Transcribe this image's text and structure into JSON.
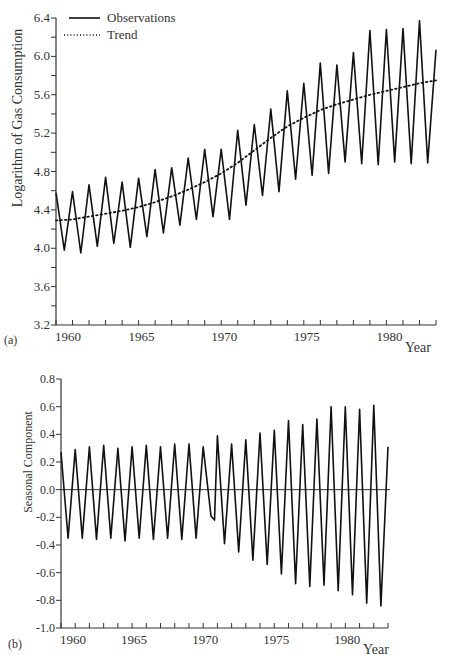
{
  "chart_data": [
    {
      "id": "a",
      "panel_label": "(a)",
      "type": "line",
      "title": "",
      "xlabel": "Year",
      "ylabel": "Logarithm of Gas Consumption",
      "xlim": [
        1960,
        1983
      ],
      "ylim": [
        3.2,
        6.4
      ],
      "x_ticks": [
        1960,
        1965,
        1970,
        1975,
        1980
      ],
      "x_tick_labels": [
        "1960",
        "1965",
        "1970",
        "1975",
        "1980"
      ],
      "y_ticks": [
        3.2,
        3.6,
        4.0,
        4.4,
        4.8,
        5.2,
        5.6,
        6.0,
        6.4
      ],
      "y_tick_labels": [
        "3.2",
        "3.6",
        "4.0",
        "4.4",
        "4.8",
        "5.2",
        "5.6",
        "6.0",
        "6.4"
      ],
      "grid": false,
      "legend": {
        "position": "top-left",
        "entries": [
          {
            "label": "Observations",
            "style": "solid"
          },
          {
            "label": "Trend",
            "style": "dotted"
          }
        ]
      },
      "series": [
        {
          "name": "Observations",
          "style": "solid",
          "x": [
            1960.0,
            1960.5,
            1961.0,
            1961.5,
            1962.0,
            1962.5,
            1963.0,
            1963.5,
            1964.0,
            1964.5,
            1965.0,
            1965.5,
            1966.0,
            1966.5,
            1967.0,
            1967.5,
            1968.0,
            1968.5,
            1969.0,
            1969.5,
            1970.0,
            1970.5,
            1971.0,
            1971.5,
            1972.0,
            1972.5,
            1973.0,
            1973.5,
            1974.0,
            1974.5,
            1975.0,
            1975.5,
            1976.0,
            1976.5,
            1977.0,
            1977.5,
            1978.0,
            1978.5,
            1979.0,
            1979.5,
            1980.0,
            1980.5,
            1981.0,
            1981.5,
            1982.0,
            1982.5,
            1983.0
          ],
          "values": [
            4.58,
            3.98,
            4.59,
            3.95,
            4.66,
            4.02,
            4.74,
            4.05,
            4.69,
            4.01,
            4.73,
            4.12,
            4.82,
            4.16,
            4.84,
            4.24,
            4.94,
            4.3,
            5.03,
            4.33,
            5.03,
            4.3,
            5.23,
            4.45,
            5.29,
            4.55,
            5.45,
            4.59,
            5.64,
            4.72,
            5.72,
            4.76,
            5.93,
            4.78,
            5.91,
            4.9,
            6.04,
            4.88,
            6.27,
            4.87,
            6.28,
            4.9,
            6.29,
            4.88,
            6.37,
            4.89,
            6.07
          ]
        },
        {
          "name": "Trend",
          "style": "dotted",
          "x": [
            1960,
            1961,
            1962,
            1963,
            1964,
            1965,
            1966,
            1967,
            1968,
            1969,
            1970,
            1971,
            1972,
            1973,
            1974,
            1975,
            1976,
            1977,
            1978,
            1979,
            1980,
            1981,
            1982,
            1983
          ],
          "values": [
            4.29,
            4.3,
            4.33,
            4.36,
            4.39,
            4.43,
            4.48,
            4.54,
            4.61,
            4.69,
            4.78,
            4.89,
            5.02,
            5.15,
            5.27,
            5.36,
            5.44,
            5.5,
            5.55,
            5.6,
            5.64,
            5.68,
            5.72,
            5.75
          ]
        }
      ]
    },
    {
      "id": "b",
      "panel_label": "(b)",
      "type": "line",
      "title": "",
      "xlabel": "Year",
      "ylabel": "Seasonal Component",
      "xlim": [
        1960,
        1983
      ],
      "ylim": [
        -1.0,
        0.8
      ],
      "x_ticks": [
        1960,
        1965,
        1970,
        1975,
        1980
      ],
      "x_tick_labels": [
        "1960",
        "1965",
        "1970",
        "1975",
        "1980"
      ],
      "y_ticks": [
        -1.0,
        -0.8,
        -0.6,
        -0.4,
        -0.2,
        0.0,
        0.2,
        0.4,
        0.6,
        0.8
      ],
      "y_tick_labels": [
        "-1.0",
        "-0.8",
        "-0.6",
        "-0.4",
        "-0.2",
        "0.0",
        "0.2",
        "0.4",
        "0.6",
        "0.8"
      ],
      "grid": false,
      "reference_line": 0.0,
      "series": [
        {
          "name": "Seasonal Component",
          "style": "solid",
          "x": [
            1960.0,
            1960.5,
            1961.0,
            1961.5,
            1962.0,
            1962.5,
            1963.0,
            1963.5,
            1964.0,
            1964.5,
            1965.0,
            1965.5,
            1966.0,
            1966.5,
            1967.0,
            1967.5,
            1968.0,
            1968.5,
            1969.0,
            1969.5,
            1970.0,
            1970.55,
            1970.8,
            1971.0,
            1971.5,
            1972.0,
            1972.5,
            1973.0,
            1973.5,
            1974.0,
            1974.5,
            1975.0,
            1975.5,
            1976.0,
            1976.5,
            1977.0,
            1977.5,
            1978.0,
            1978.5,
            1979.0,
            1979.5,
            1980.0,
            1980.5,
            1981.0,
            1981.5,
            1982.0,
            1982.5,
            1983.0
          ],
          "values": [
            0.27,
            -0.35,
            0.29,
            -0.35,
            0.31,
            -0.36,
            0.32,
            -0.35,
            0.3,
            -0.37,
            0.31,
            -0.35,
            0.32,
            -0.36,
            0.31,
            -0.35,
            0.33,
            -0.36,
            0.33,
            -0.35,
            0.31,
            -0.19,
            -0.22,
            0.39,
            -0.39,
            0.33,
            -0.45,
            0.36,
            -0.51,
            0.41,
            -0.54,
            0.43,
            -0.61,
            0.5,
            -0.68,
            0.47,
            -0.7,
            0.51,
            -0.69,
            0.6,
            -0.73,
            0.6,
            -0.76,
            0.58,
            -0.82,
            0.61,
            -0.84,
            0.31
          ]
        }
      ]
    }
  ]
}
